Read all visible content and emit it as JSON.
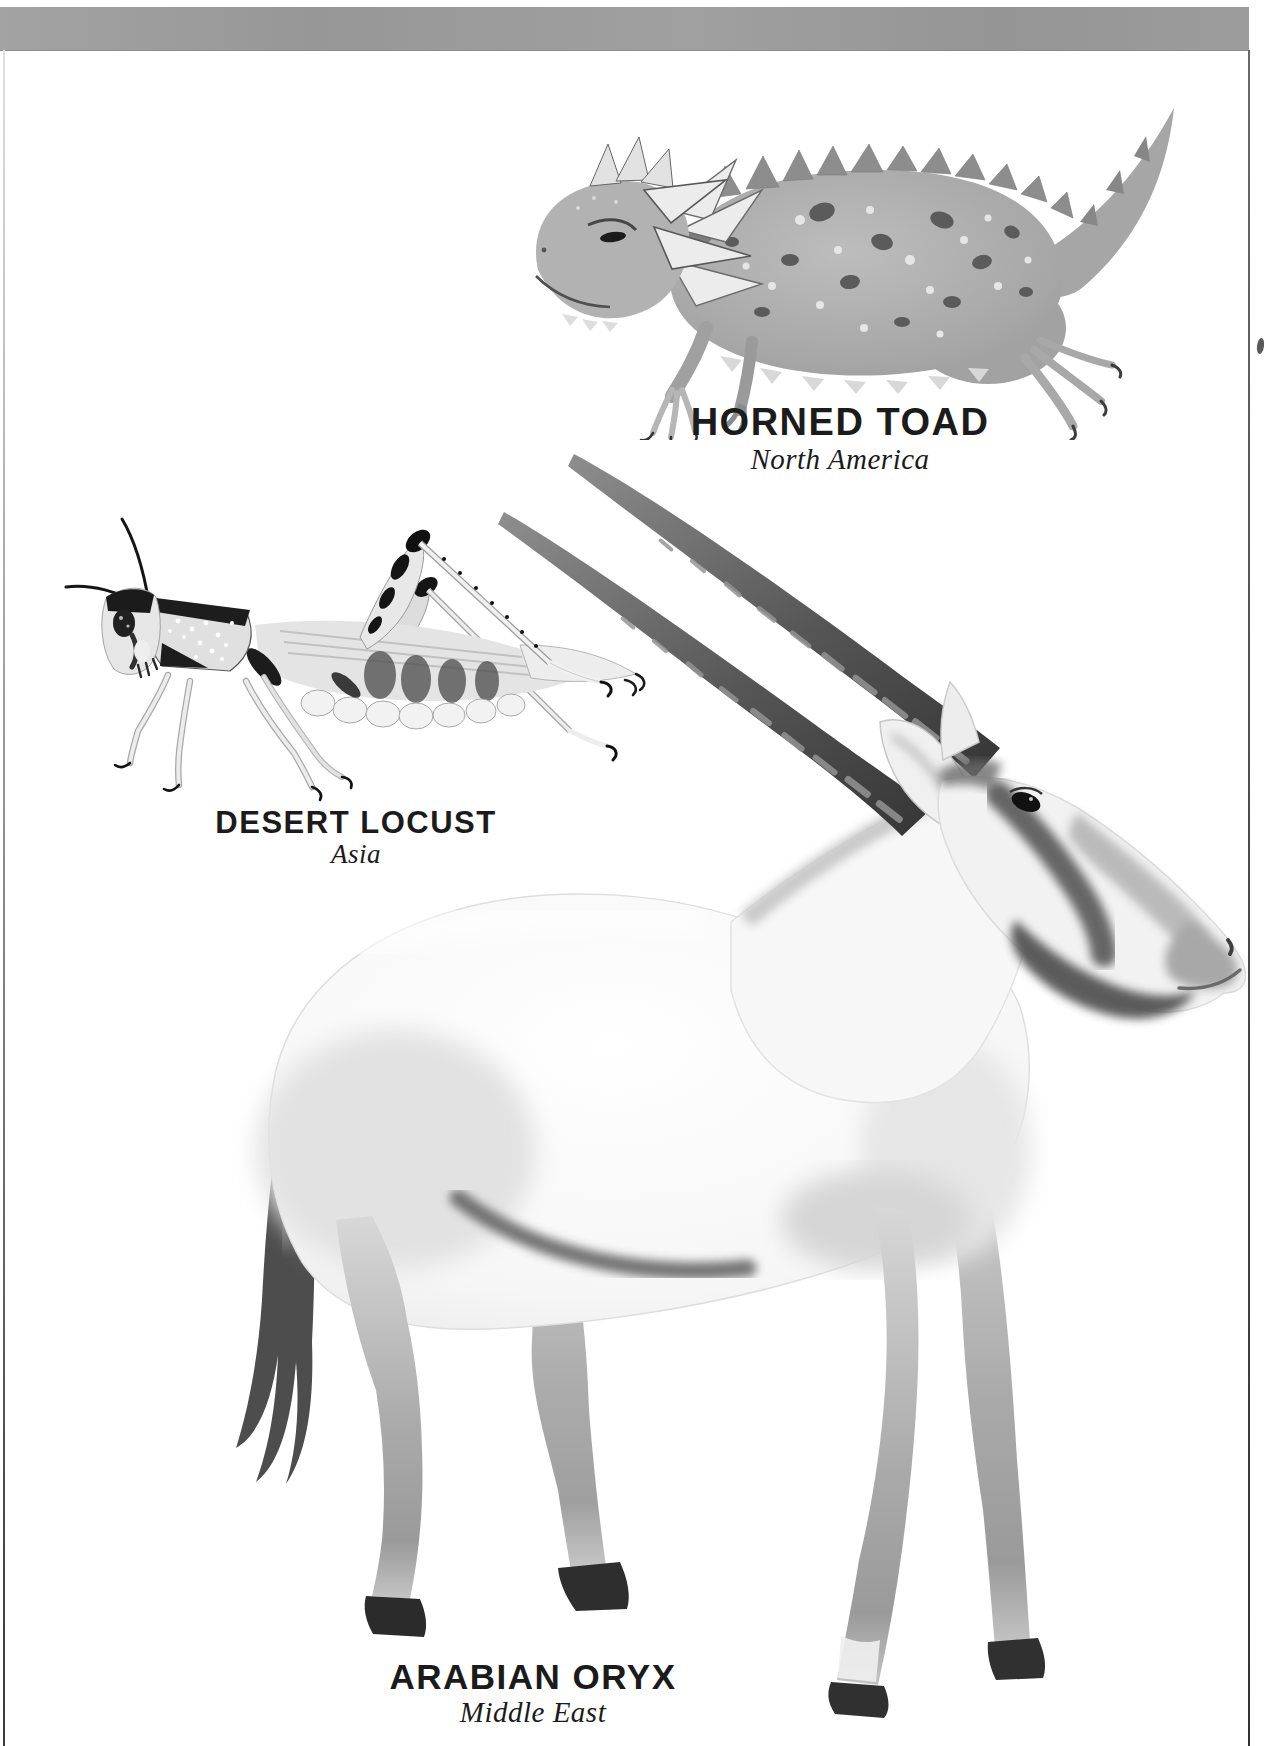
{
  "page": {
    "background": "#ffffff",
    "top_bar_color": "#9b9b9b",
    "edge_rule_color": "#444444"
  },
  "figures": [
    {
      "id": "horned-toad",
      "name": "HORNED TOAD",
      "region": "North America",
      "icon": "horned-lizard-illustration"
    },
    {
      "id": "desert-locust",
      "name": "DESERT LOCUST",
      "region": "Asia",
      "icon": "locust-illustration"
    },
    {
      "id": "arabian-oryx",
      "name": "ARABIAN ORYX",
      "region": "Middle East",
      "icon": "oryx-illustration"
    }
  ]
}
